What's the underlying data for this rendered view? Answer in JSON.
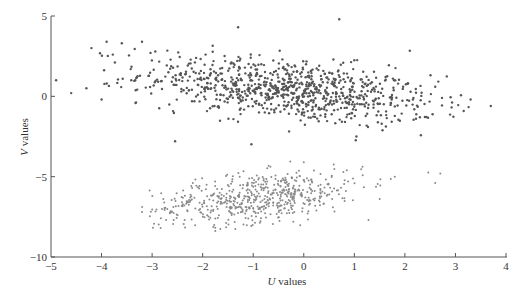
{
  "chart_data": {
    "type": "scatter",
    "title": "",
    "xlabel": "U values",
    "xlabel_italic": "U",
    "xlabel_rest": " values",
    "ylabel": "V values",
    "ylabel_italic": "V",
    "ylabel_rest": " values",
    "xlim": [
      -5,
      4
    ],
    "ylim": [
      -10,
      5
    ],
    "xticks": [
      -5,
      -4,
      -3,
      -2,
      -1,
      0,
      1,
      2,
      3,
      4
    ],
    "yticks": [
      -10,
      -5,
      0,
      5
    ],
    "grid": false,
    "legend": null,
    "series": [
      {
        "name": "upper cluster",
        "marker": "dot-dark",
        "color": "#555555",
        "count": 900,
        "center": [
          -0.3,
          0.4
        ],
        "std": [
          1.45,
          1.05
        ],
        "correlation": -0.45,
        "x_range": [
          -5.0,
          3.7
        ],
        "y_range": [
          -3.0,
          4.8
        ],
        "outliers": [
          [
            -4.9,
            1.0
          ],
          [
            -4.6,
            0.2
          ],
          [
            -4.3,
            0.5
          ],
          [
            -4.2,
            3.0
          ],
          [
            -3.9,
            3.4
          ],
          [
            -4.0,
            -0.2
          ],
          [
            -3.6,
            3.3
          ],
          [
            -3.2,
            3.4
          ],
          [
            3.3,
            -0.2
          ],
          [
            3.7,
            -0.6
          ],
          [
            0.7,
            4.8
          ],
          [
            -1.3,
            4.3
          ],
          [
            2.6,
            0.6
          ]
        ]
      },
      {
        "name": "lower cluster",
        "marker": "dot-light",
        "color": "#8a8a8a",
        "count": 600,
        "center": [
          -0.9,
          -6.3
        ],
        "std": [
          1.05,
          0.85
        ],
        "correlation": 0.45,
        "x_range": [
          -3.2,
          2.8
        ],
        "y_range": [
          -8.6,
          -4.0
        ],
        "outliers": [
          [
            -3.2,
            -7.2
          ],
          [
            2.6,
            -5.4
          ],
          [
            2.7,
            -4.8
          ],
          [
            1.8,
            -5.0
          ],
          [
            0.0,
            -4.1
          ]
        ]
      }
    ]
  }
}
